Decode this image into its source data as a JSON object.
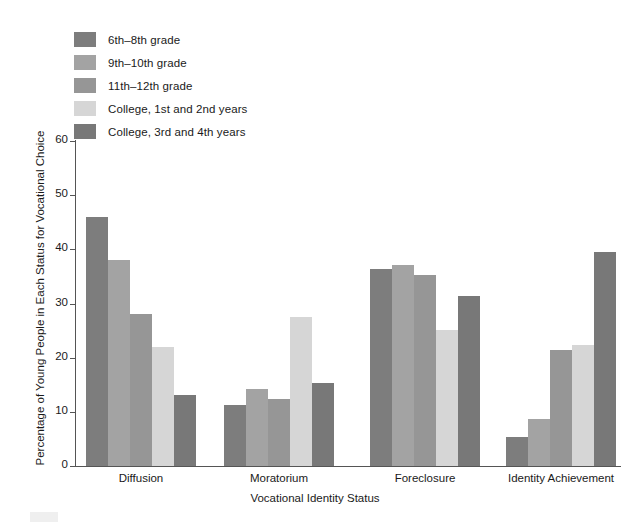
{
  "legend": {
    "items": [
      {
        "label": "6th–8th grade",
        "color": "#7d7d7d"
      },
      {
        "label": "9th–10th grade",
        "color": "#a3a3a3"
      },
      {
        "label": "11th–12th grade",
        "color": "#969696"
      },
      {
        "label": "College, 1st and 2nd years",
        "color": "#d6d6d6"
      },
      {
        "label": "College, 3rd and 4th years",
        "color": "#787878"
      }
    ]
  },
  "axes": {
    "y_ticks": [
      "0",
      "10",
      "20",
      "30",
      "40",
      "50",
      "60"
    ],
    "x_title": "Vocational Identity Status",
    "y_title": "Percentage of Young People in Each Status for Vocational Choice"
  },
  "chart_data": {
    "type": "bar",
    "title": "",
    "xlabel": "Vocational Identity Status",
    "ylabel": "Percentage of Young People in Each Status for Vocational Choice",
    "categories": [
      "Diffusion",
      "Moratorium",
      "Foreclosure",
      "Identity Achievement"
    ],
    "series": [
      {
        "name": "6th–8th grade",
        "color": "#7d7d7d",
        "values": [
          46.0,
          11.2,
          36.3,
          5.3
        ]
      },
      {
        "name": "9th–10th grade",
        "color": "#a3a3a3",
        "values": [
          38.0,
          14.2,
          37.2,
          8.6
        ]
      },
      {
        "name": "11th–12th grade",
        "color": "#969696",
        "values": [
          28.0,
          12.3,
          35.3,
          21.5
        ]
      },
      {
        "name": "College, 1st and 2nd years",
        "color": "#d6d6d6",
        "values": [
          22.0,
          27.6,
          25.2,
          22.3
        ]
      },
      {
        "name": "College, 3rd and 4th years",
        "color": "#787878",
        "values": [
          13.2,
          15.3,
          31.3,
          39.5
        ]
      }
    ],
    "ylim": [
      0,
      60
    ],
    "ytick_step": 10,
    "grid": false,
    "legend_position": "top-left"
  }
}
